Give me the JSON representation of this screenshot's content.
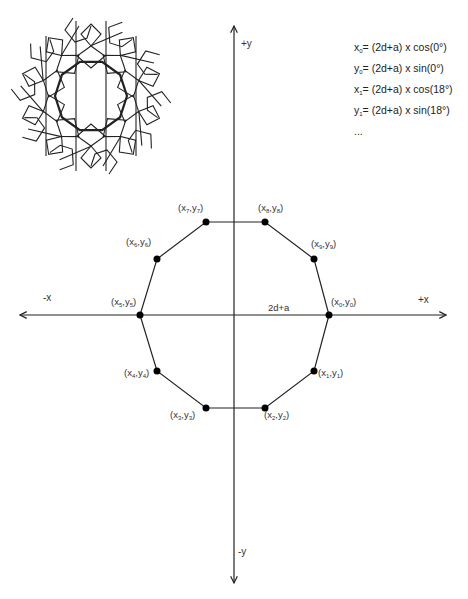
{
  "formulas": {
    "lines": [
      {
        "var": "x",
        "sub": "0",
        "expr": "= (2d+a) x cos(0°)"
      },
      {
        "var": "y",
        "sub": "0",
        "expr": "= (2d+a) x sin(0°)"
      },
      {
        "var": "x",
        "sub": "1",
        "expr": "= (2d+a) x cos(18°)"
      },
      {
        "var": "y",
        "sub": "1",
        "expr": "= (2d+a) x sin(18°)"
      }
    ],
    "ellipsis": "..."
  },
  "axes": {
    "plus_x": "+x",
    "minus_x": "-x",
    "plus_y": "+y",
    "minus_y": "-y",
    "radius_label": "2d+a"
  },
  "points": [
    {
      "id": "p0",
      "x_sub": "0",
      "y_sub": "0"
    },
    {
      "id": "p1",
      "x_sub": "1",
      "y_sub": "1"
    },
    {
      "id": "p2",
      "x_sub": "2",
      "y_sub": "2"
    },
    {
      "id": "p3",
      "x_sub": "3",
      "y_sub": "3"
    },
    {
      "id": "p4",
      "x_sub": "4",
      "y_sub": "4"
    },
    {
      "id": "p5",
      "x_sub": "5",
      "y_sub": "5"
    },
    {
      "id": "p6",
      "x_sub": "6",
      "y_sub": "6"
    },
    {
      "id": "p7",
      "x_sub": "7",
      "y_sub": "7"
    },
    {
      "id": "p8",
      "x_sub": "8",
      "y_sub": "8"
    },
    {
      "id": "p9",
      "x_sub": "9",
      "y_sub": "9"
    }
  ],
  "thumbnail": {
    "name": "islamic-geometric-pattern"
  }
}
